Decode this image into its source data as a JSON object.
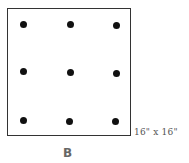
{
  "diagram": {
    "figure_label": "B",
    "size_label": "16\" x 16\"",
    "grid": {
      "rows": 3,
      "columns": 3,
      "dot_count": 9,
      "dots": [
        {
          "row": 1,
          "col": 1,
          "x": 23,
          "y": 24
        },
        {
          "row": 1,
          "col": 2,
          "x": 70,
          "y": 24
        },
        {
          "row": 1,
          "col": 3,
          "x": 116,
          "y": 25
        },
        {
          "row": 2,
          "col": 1,
          "x": 23,
          "y": 71
        },
        {
          "row": 2,
          "col": 2,
          "x": 70,
          "y": 72
        },
        {
          "row": 2,
          "col": 3,
          "x": 116,
          "y": 73
        },
        {
          "row": 3,
          "col": 1,
          "x": 23,
          "y": 120
        },
        {
          "row": 3,
          "col": 2,
          "x": 69,
          "y": 121
        },
        {
          "row": 3,
          "col": 3,
          "x": 115,
          "y": 121
        }
      ]
    },
    "colors": {
      "border": "#333333",
      "dot": "#111111",
      "label": "#555555",
      "figure_label": "#666666"
    }
  }
}
